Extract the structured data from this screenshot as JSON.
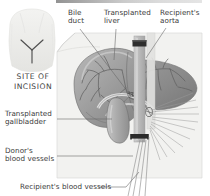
{
  "figure": {
    "title_strip": "",
    "type": "medical-illustration",
    "palette": {
      "background": "#ffffff",
      "drape_panel": "#f1f1ef",
      "drape_panel_edge": "#d8d8d6",
      "liver_dark": "#8e8e8e",
      "liver_mid": "#a5a5a5",
      "liver_light": "#c2c2c2",
      "gallbladder": "#b0b0b0",
      "vessel_trunk": "#bdbdbd",
      "clamp": "#2f2f2f",
      "vessel_line": "#6e6e6e",
      "leader_line": "#6a6a6a",
      "torso": "#ededeb",
      "incision_mark": "#555555",
      "label_text": "#3a3a3a"
    },
    "inset": {
      "name": "torso-incision-inset",
      "caption": "SITE OF\nINCISION",
      "incision_shape": "Y-shaped (Mercedes) incision"
    },
    "labels": [
      {
        "id": "bile-duct",
        "text": "Bile\nduct",
        "x": 68,
        "y": 11,
        "align": "left"
      },
      {
        "id": "transplanted-liver",
        "text": "Transplanted\nliver",
        "x": 104,
        "y": 11,
        "align": "left"
      },
      {
        "id": "recipients-aorta",
        "text": "Recipient's\naorta",
        "x": 162,
        "y": 11,
        "align": "left"
      },
      {
        "id": "transplanted-gallbladder",
        "text": "Transplanted\ngallbladder",
        "x": 6,
        "y": 110,
        "align": "left"
      },
      {
        "id": "donors-blood-vessels",
        "text": "Donor's\nblood vessels",
        "x": 6,
        "y": 146,
        "align": "left"
      },
      {
        "id": "recipients-blood-vessels",
        "text": "Recipient's blood vessels",
        "x": 20,
        "y": 184,
        "align": "left"
      }
    ]
  }
}
